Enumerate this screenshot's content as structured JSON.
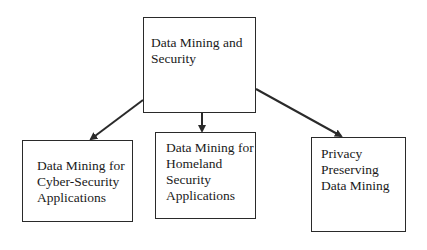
{
  "diagram": {
    "type": "hierarchy",
    "root": {
      "id": "root",
      "lines": [
        "Data Mining and",
        "Security"
      ]
    },
    "children": [
      {
        "id": "cyber",
        "lines": [
          "Data Mining for",
          "Cyber-Security",
          "Applications"
        ]
      },
      {
        "id": "homeland",
        "lines": [
          "Data Mining for",
          "Homeland",
          "Security",
          "Applications"
        ]
      },
      {
        "id": "privacy",
        "lines": [
          "Privacy",
          "Preserving",
          "Data Mining"
        ]
      }
    ],
    "edges": [
      {
        "from": "root",
        "to": "cyber"
      },
      {
        "from": "root",
        "to": "homeland"
      },
      {
        "from": "root",
        "to": "privacy"
      }
    ],
    "colors": {
      "line": "#2a2a2a",
      "background": "#ffffff",
      "text": "#1a1a1a"
    }
  }
}
